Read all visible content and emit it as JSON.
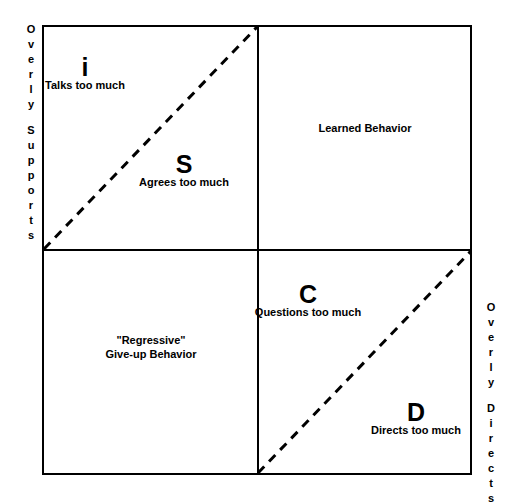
{
  "diagram": {
    "axes": {
      "left": {
        "name": "overly-supports-axis",
        "line1": "Overly",
        "line2": "Supports"
      },
      "right": {
        "name": "overly-directs-axis",
        "line1": "Overly",
        "line2": "Directs"
      }
    },
    "quadrants": [
      {
        "id": "top-left",
        "letter": "i",
        "caption": "Talks too much"
      },
      {
        "id": "top-left-lower",
        "letter": "S",
        "caption": "Agrees too much"
      },
      {
        "id": "top-right",
        "letter": "",
        "caption": "Learned Behavior"
      },
      {
        "id": "bottom-left",
        "letter": "",
        "caption_line1": "\"Regressive\"",
        "caption_line2": "Give-up Behavior"
      },
      {
        "id": "bottom-right-upper",
        "letter": "C",
        "caption": "Questions too much"
      },
      {
        "id": "bottom-right-lower",
        "letter": "D",
        "caption": "Directs too much"
      }
    ],
    "style": {
      "line_color": "#000000",
      "background": "#ffffff",
      "dash_pattern": "9 7"
    }
  }
}
